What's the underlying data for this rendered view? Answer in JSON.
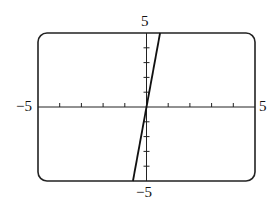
{
  "chart_data": {
    "type": "line",
    "title": "",
    "xlabel": "",
    "ylabel": "",
    "xlim": [
      -5,
      5
    ],
    "ylim": [
      -5,
      5
    ],
    "xticks_step": 1,
    "yticks_step": 1,
    "grid": false,
    "legend": null,
    "series": [
      {
        "name": "y = 8x",
        "x": [
          -0.625,
          0.625
        ],
        "y": [
          -5,
          5
        ]
      }
    ],
    "tick_labels": {
      "x_min": "−5",
      "x_max": "5",
      "y_min": "−5",
      "y_max": "5"
    }
  }
}
